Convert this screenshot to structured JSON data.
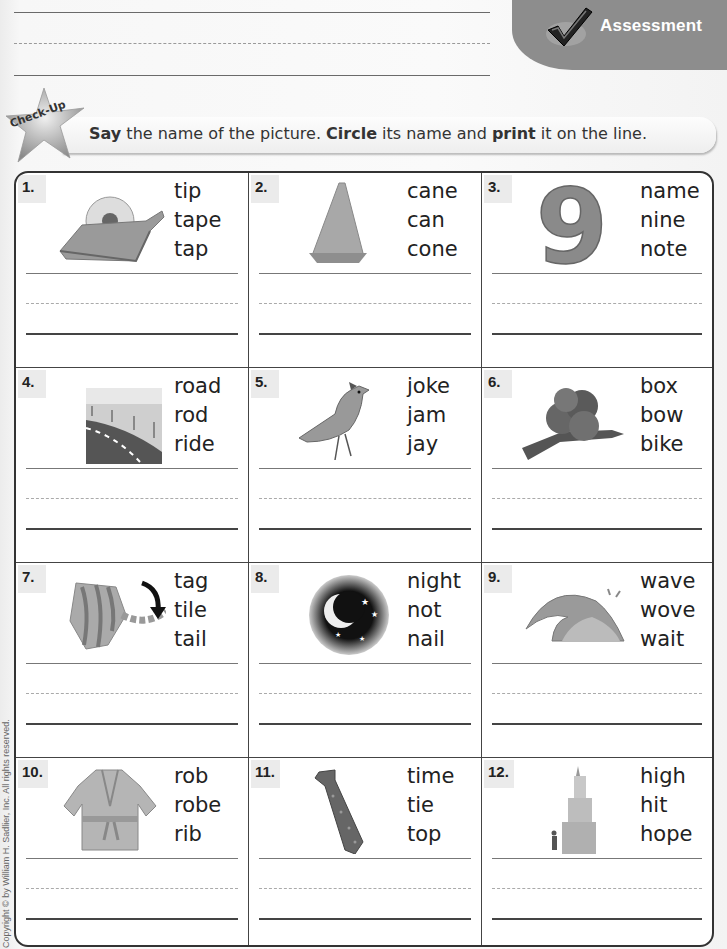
{
  "header": {
    "badge_label": "Assessment",
    "badge_icon": "checkmark-icon",
    "badge_color": "#8d8d8d"
  },
  "instruction": {
    "star_label": "Check-Up",
    "parts": [
      {
        "text": "Say",
        "bold": true
      },
      {
        "text": " the name of the picture. ",
        "bold": false
      },
      {
        "text": "Circle",
        "bold": true
      },
      {
        "text": " its name and ",
        "bold": false
      },
      {
        "text": "print",
        "bold": true
      },
      {
        "text": " it on the line.",
        "bold": false
      }
    ]
  },
  "items": [
    {
      "number": "1.",
      "picture": "tape-dispenser",
      "choices": [
        "tip",
        "tape",
        "tap"
      ]
    },
    {
      "number": "2.",
      "picture": "traffic-cone",
      "choices": [
        "cane",
        "can",
        "cone"
      ]
    },
    {
      "number": "3.",
      "picture": "number-nine",
      "choices": [
        "name",
        "nine",
        "note"
      ]
    },
    {
      "number": "4.",
      "picture": "road",
      "choices": [
        "road",
        "rod",
        "ride"
      ]
    },
    {
      "number": "5.",
      "picture": "blue-jay-bird",
      "choices": [
        "joke",
        "jam",
        "jay"
      ]
    },
    {
      "number": "6.",
      "picture": "ribbon-bow",
      "choices": [
        "box",
        "bow",
        "bike"
      ]
    },
    {
      "number": "7.",
      "picture": "cat-tail",
      "choices": [
        "tag",
        "tile",
        "tail"
      ]
    },
    {
      "number": "8.",
      "picture": "moon-night-sky",
      "choices": [
        "night",
        "not",
        "nail"
      ]
    },
    {
      "number": "9.",
      "picture": "ocean-wave",
      "choices": [
        "wave",
        "wove",
        "wait"
      ]
    },
    {
      "number": "10.",
      "picture": "bathrobe",
      "choices": [
        "rob",
        "robe",
        "rib"
      ]
    },
    {
      "number": "11.",
      "picture": "necktie",
      "choices": [
        "time",
        "tie",
        "top"
      ]
    },
    {
      "number": "12.",
      "picture": "tall-building",
      "choices": [
        "high",
        "hit",
        "hope"
      ]
    }
  ],
  "footer": {
    "copyright": "Copyright © by William H. Sadlier, Inc. All rights reserved."
  }
}
